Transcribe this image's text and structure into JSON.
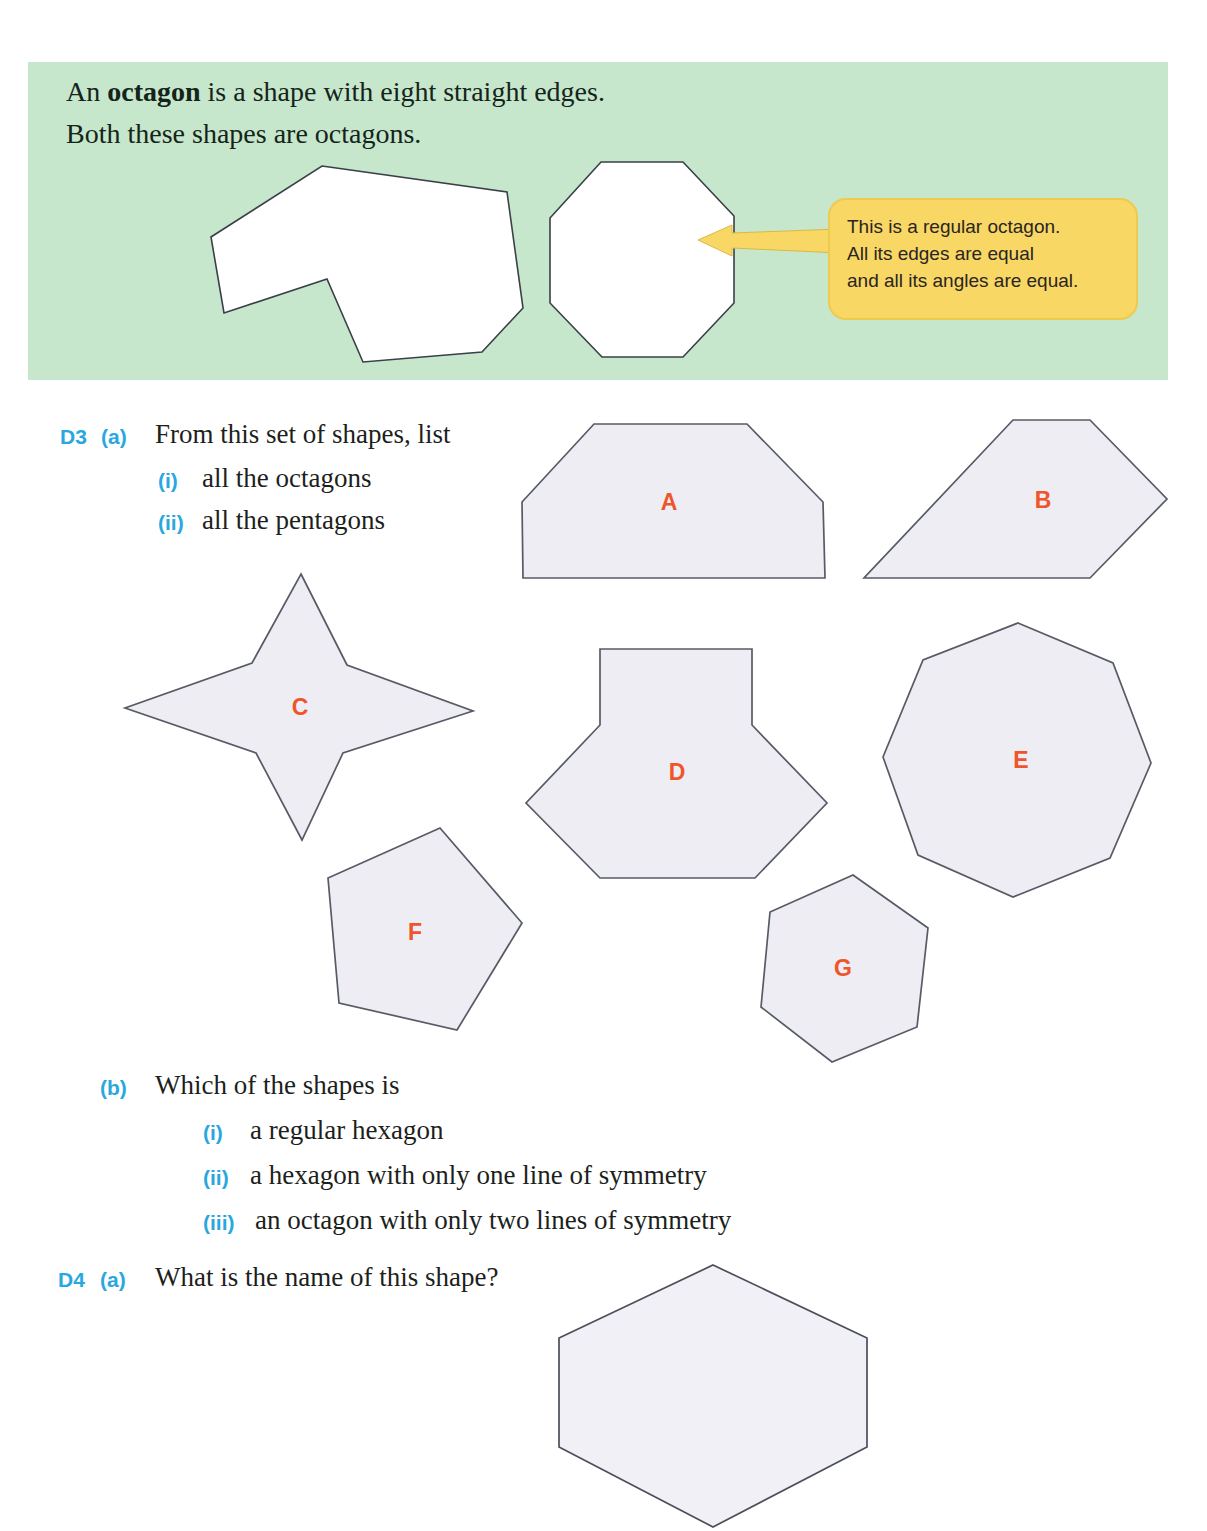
{
  "info_box": {
    "line1_prefix": "An ",
    "line1_bold": "octagon",
    "line1_suffix": " is a shape with eight straight edges.",
    "line2": "Both these shapes are octagons.",
    "callout": {
      "lines": [
        "This is a regular octagon.",
        "All its edges are equal",
        "and all its angles are equal."
      ]
    }
  },
  "shape_labels": {
    "a": "A",
    "b": "B",
    "c": "C",
    "d": "D",
    "e": "E",
    "f": "F",
    "g": "G"
  },
  "questions": {
    "d3": {
      "number": "D3",
      "part": "(a)",
      "prompt": "From this set of shapes, list",
      "items": [
        {
          "marker": "(i)",
          "text": "all the octagons"
        },
        {
          "marker": "(ii)",
          "text": "all the pentagons"
        }
      ]
    },
    "d3b": {
      "part": "(b)",
      "prompt": "Which of the shapes is",
      "items": [
        {
          "marker": "(i)",
          "text": "a regular hexagon"
        },
        {
          "marker": "(ii)",
          "text": "a hexagon with only one line of symmetry"
        },
        {
          "marker": "(iii)",
          "text": "an octagon with only two lines of symmetry"
        }
      ]
    },
    "d4": {
      "number": "D4",
      "part": "(a)",
      "prompt": "What is the name of this shape?"
    }
  },
  "colors": {
    "info_box_background": "#c6e7cc",
    "callout_fill": "#f8d765",
    "shape_fill": "#ededf3",
    "shape_stroke": "#565b66",
    "label_orange": "#f0542a",
    "marker_blue": "#29a7de"
  }
}
